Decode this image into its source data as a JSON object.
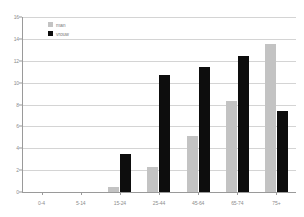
{
  "chart_data": {
    "type": "bar",
    "title": "",
    "subtitle": "",
    "xlabel": "",
    "ylabel": "",
    "categories": [
      "0-4",
      "5-14",
      "15-24",
      "25-44",
      "45-64",
      "65-74",
      "75+"
    ],
    "series": [
      {
        "name": "man",
        "color": "#c3c3c3",
        "values": [
          0,
          0,
          0.5,
          2.3,
          5.1,
          8.3,
          13.5
        ]
      },
      {
        "name": "vrouw",
        "color": "#0d0d0d",
        "values": [
          0,
          0,
          3.5,
          10.7,
          11.4,
          12.4,
          7.4
        ]
      }
    ],
    "ylim": [
      0,
      16
    ],
    "yticks": [
      0,
      2,
      4,
      6,
      8,
      10,
      12,
      14,
      16
    ],
    "ytick_labels": [
      "0",
      "2",
      "4",
      "6",
      "8",
      "10",
      "12",
      "14",
      "16"
    ],
    "grid": true,
    "legend_position": "top-left",
    "legend_entries": [
      "man",
      "vrouw"
    ]
  },
  "legend": {
    "man_label": "man",
    "vrouw_label": "vrouw"
  },
  "colors": {
    "man": "#c3c3c3",
    "vrouw": "#0d0d0d",
    "grid": "#d4d4d4",
    "axis": "#9a9a9a",
    "tick_text": "#8d8d8d",
    "background": "#ffffff"
  }
}
